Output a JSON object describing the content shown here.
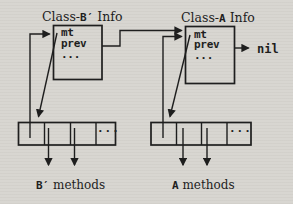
{
  "figure": {
    "colors": {
      "paper": "#d8d6d1",
      "ink": "#1e1e1e"
    },
    "left": {
      "title_prefix": "Class-",
      "title_class": "B′",
      "title_suffix": " Info",
      "field_mt": "mt",
      "field_prev": "prev",
      "field_ellipsis": "...",
      "table_ellipsis": "...",
      "methods_class": "B′",
      "methods_suffix": " methods"
    },
    "right": {
      "title_prefix": "Class-",
      "title_class": "A",
      "title_suffix": " Info",
      "field_mt": "mt",
      "field_prev": "prev",
      "field_ellipsis": "...",
      "table_ellipsis": "...",
      "methods_class": "A",
      "methods_suffix": " methods",
      "nil_label": "nil"
    }
  }
}
